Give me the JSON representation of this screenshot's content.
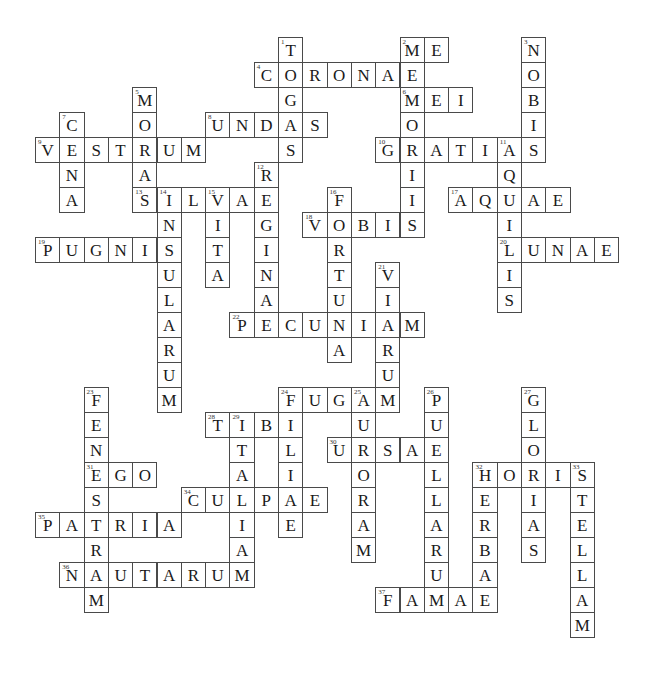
{
  "puzzle": {
    "type": "crossword",
    "grid": {
      "x0": 10.7,
      "y0": 37,
      "cell_w": 24.3,
      "cell_h": 25
    },
    "colors": {
      "border": "#4a4a4a",
      "text": "#1a1a1a",
      "background": "#ffffff"
    },
    "across": [
      {
        "num": 2,
        "col": 16,
        "row": 0,
        "word": "ME"
      },
      {
        "num": 4,
        "col": 10,
        "row": 1,
        "word": "CORONAE"
      },
      {
        "num": 6,
        "col": 16,
        "row": 2,
        "word": "MEI"
      },
      {
        "num": 8,
        "col": 8,
        "row": 3,
        "word": "UNDAS"
      },
      {
        "num": 9,
        "col": 1,
        "row": 4,
        "word": "VESTRUM"
      },
      {
        "num": 10,
        "col": 15,
        "row": 4,
        "word": "GRATIAS"
      },
      {
        "num": 13,
        "col": 5,
        "row": 6,
        "word": "SILVAE"
      },
      {
        "num": 17,
        "col": 18,
        "row": 6,
        "word": "AQUAE"
      },
      {
        "num": 18,
        "col": 12,
        "row": 7,
        "word": "VOBIS"
      },
      {
        "num": 19,
        "col": 1,
        "row": 8,
        "word": "PUGNIS"
      },
      {
        "num": 20,
        "col": 20,
        "row": 8,
        "word": "LUNAE"
      },
      {
        "num": 22,
        "col": 9,
        "row": 11,
        "word": "PECUNIAM"
      },
      {
        "num": 24,
        "col": 11,
        "row": 14,
        "word": "FUGAM"
      },
      {
        "num": 28,
        "col": 8,
        "row": 15,
        "word": "TIBI"
      },
      {
        "num": 30,
        "col": 13,
        "row": 16,
        "word": "URSAE"
      },
      {
        "num": 31,
        "col": 3,
        "row": 17,
        "word": "EGO"
      },
      {
        "num": 32,
        "col": 19,
        "row": 17,
        "word": "HORIS"
      },
      {
        "num": 34,
        "col": 7,
        "row": 18,
        "word": "CULPAE"
      },
      {
        "num": 35,
        "col": 1,
        "row": 19,
        "word": "PATRIA"
      },
      {
        "num": 36,
        "col": 2,
        "row": 21,
        "word": "NAUTARUM"
      },
      {
        "num": 37,
        "col": 15,
        "row": 22,
        "word": "FAMAE"
      }
    ],
    "down": [
      {
        "num": 1,
        "col": 11,
        "row": 0,
        "word": "TOGAS"
      },
      {
        "num": 2,
        "col": 16,
        "row": 0,
        "word": "MEMORIIS"
      },
      {
        "num": 3,
        "col": 21,
        "row": 0,
        "word": "NOBIS"
      },
      {
        "num": 5,
        "col": 5,
        "row": 2,
        "word": "MORAS"
      },
      {
        "num": 7,
        "col": 2,
        "row": 3,
        "word": "CENA"
      },
      {
        "num": 11,
        "col": 20,
        "row": 4,
        "word": "AQUILIS"
      },
      {
        "num": 12,
        "col": 10,
        "row": 5,
        "word": "REGINA"
      },
      {
        "num": 14,
        "col": 6,
        "row": 6,
        "word": "INSULARUM"
      },
      {
        "num": 15,
        "col": 8,
        "row": 6,
        "word": "VITA"
      },
      {
        "num": 16,
        "col": 13,
        "row": 6,
        "word": "FORTUNA"
      },
      {
        "num": 21,
        "col": 15,
        "row": 9,
        "word": "VIARUM"
      },
      {
        "num": 23,
        "col": 3,
        "row": 14,
        "word": "FENESTRAM"
      },
      {
        "num": 24,
        "col": 11,
        "row": 14,
        "word": "FILIAE"
      },
      {
        "num": 25,
        "col": 14,
        "row": 14,
        "word": "AURORAM"
      },
      {
        "num": 26,
        "col": 17,
        "row": 14,
        "word": "PUELLARUM"
      },
      {
        "num": 27,
        "col": 21,
        "row": 14,
        "word": "GLORIAS"
      },
      {
        "num": 29,
        "col": 9,
        "row": 15,
        "word": "ITALIAM"
      },
      {
        "num": 32,
        "col": 19,
        "row": 17,
        "word": "HERBAE"
      },
      {
        "num": 33,
        "col": 23,
        "row": 17,
        "word": "STELLAM"
      }
    ]
  }
}
